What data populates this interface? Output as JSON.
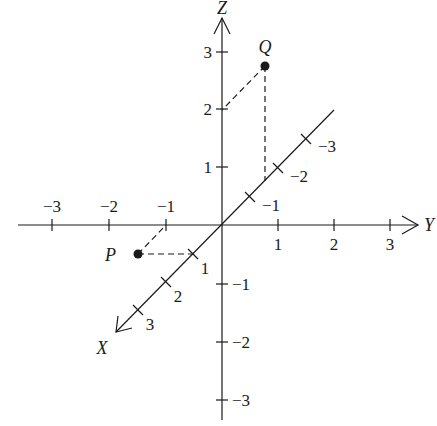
{
  "diagram": {
    "type": "3d-coordinate-axes",
    "axes": {
      "x": {
        "label": "X",
        "ticks": [
          "1",
          "2",
          "3",
          "−1",
          "−2",
          "−3"
        ]
      },
      "y": {
        "label": "Y",
        "ticks": [
          "1",
          "2",
          "3",
          "−1",
          "−2",
          "−3"
        ]
      },
      "z": {
        "label": "Z",
        "ticks": [
          "1",
          "2",
          "3",
          "−1",
          "−2",
          "−3"
        ]
      }
    },
    "points": {
      "p": {
        "label": "P"
      },
      "q": {
        "label": "Q"
      }
    },
    "colors": {
      "ink": "#1a1a1a",
      "background": "#ffffff"
    }
  }
}
